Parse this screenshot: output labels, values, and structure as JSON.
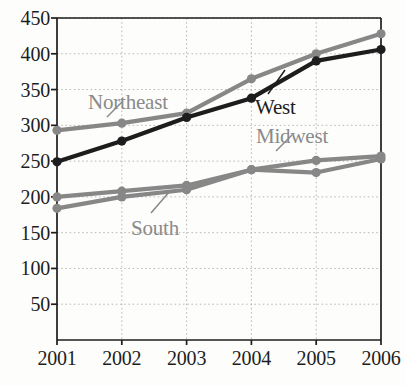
{
  "chart_data": {
    "type": "line",
    "title": "",
    "subtitle": "",
    "xlabel": "",
    "ylabel": "",
    "categories": [
      "2001",
      "2002",
      "2003",
      "2004",
      "2005",
      "2006"
    ],
    "x": [
      2001,
      2002,
      2003,
      2004,
      2005,
      2006
    ],
    "xlim": [
      2001,
      2006
    ],
    "ylim": [
      0,
      450
    ],
    "ytick_labels": [
      "450",
      "400",
      "350",
      "300",
      "250",
      "200",
      "150",
      "100",
      "50"
    ],
    "yticks": [
      450,
      400,
      350,
      300,
      250,
      200,
      150,
      100,
      50
    ],
    "grid": true,
    "grid_style": "dotted",
    "grid_color": "#b9b9b9",
    "legend_position": "inline-annotations",
    "markers": "circle",
    "series": [
      {
        "name": "Northeast",
        "color": "#878787",
        "values": [
          293,
          303,
          317,
          365,
          400,
          428
        ],
        "label_x": 88,
        "label_y": 92,
        "leader": {
          "x1": 107,
          "y1": 117,
          "x2": 123,
          "y2": 101
        }
      },
      {
        "name": "West",
        "color": "#1d1d1d",
        "values": [
          249,
          278,
          311,
          338,
          390,
          406
        ],
        "label_x": 255,
        "label_y": 97,
        "leader": {
          "x1": 268,
          "y1": 94,
          "x2": 285,
          "y2": 70
        }
      },
      {
        "name": "Midwest",
        "color": "#878787",
        "values": [
          200,
          208,
          216,
          238,
          251,
          257
        ],
        "label_x": 256,
        "label_y": 126,
        "leader": {
          "x1": 276,
          "y1": 151,
          "x2": 292,
          "y2": 135
        }
      },
      {
        "name": "South",
        "color": "#878787",
        "values": [
          184,
          200,
          210,
          238,
          234,
          253
        ],
        "label_x": 131,
        "label_y": 218,
        "leader": {
          "x1": 151,
          "y1": 213,
          "x2": 170,
          "y2": 191
        }
      }
    ],
    "axis_color": "#1d1d1d",
    "background": "#fdfdfc"
  }
}
